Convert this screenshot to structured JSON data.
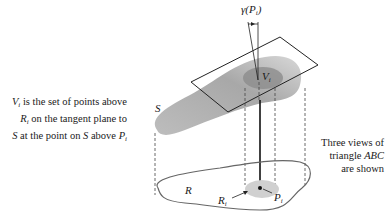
{
  "figure": {
    "left_caption": {
      "line1_var": "V",
      "line1_sub": "i",
      "line1_rest": " is the set of points above",
      "line2_var": "R",
      "line2_sub": "i",
      "line2_rest": " on the tangent plane to",
      "line3_a": "S",
      "line3_b": " at the point on ",
      "line3_c": "S",
      "line3_d": " above ",
      "line3_var": "P",
      "line3_sub": "i"
    },
    "right_caption": {
      "line1": "Three views of",
      "line2_a": "triangle ",
      "line2_var": "ABC",
      "line3": "are shown"
    },
    "labels": {
      "gamma": "γ(P",
      "gamma_sub": "i",
      "gamma_close": ")",
      "V": "V",
      "V_sub": "i",
      "S": "S",
      "R": "R",
      "Ri": "R",
      "Ri_sub": "i",
      "Pi": "P",
      "Pi_sub": "i"
    },
    "colors": {
      "surface_shade": "#9a9a9a",
      "patch_shade": "#8c8c8c",
      "region_fill": "#d0d0d0",
      "line": "#222222"
    }
  }
}
